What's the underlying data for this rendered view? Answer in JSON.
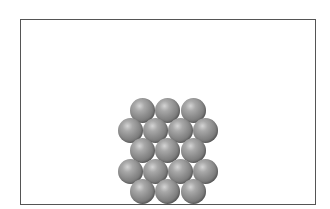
{
  "diagram": {
    "container": {
      "left": 20,
      "top": 19,
      "width": 294,
      "height": 184,
      "border_color": "#555555"
    },
    "sphere_color": "#8a8a8a",
    "sphere_diameter": 25,
    "rows": [
      {
        "count": 3,
        "y": 110,
        "x": [
          142,
          167.5,
          193
        ]
      },
      {
        "count": 4,
        "y": 130.5,
        "x": [
          130,
          155,
          180,
          205
        ]
      },
      {
        "count": 3,
        "y": 150.5,
        "x": [
          142,
          167.5,
          193
        ]
      },
      {
        "count": 4,
        "y": 171,
        "x": [
          130,
          155,
          180,
          205
        ]
      },
      {
        "count": 3,
        "y": 191,
        "x": [
          142,
          167.5,
          193
        ]
      }
    ],
    "total_spheres": 17
  }
}
